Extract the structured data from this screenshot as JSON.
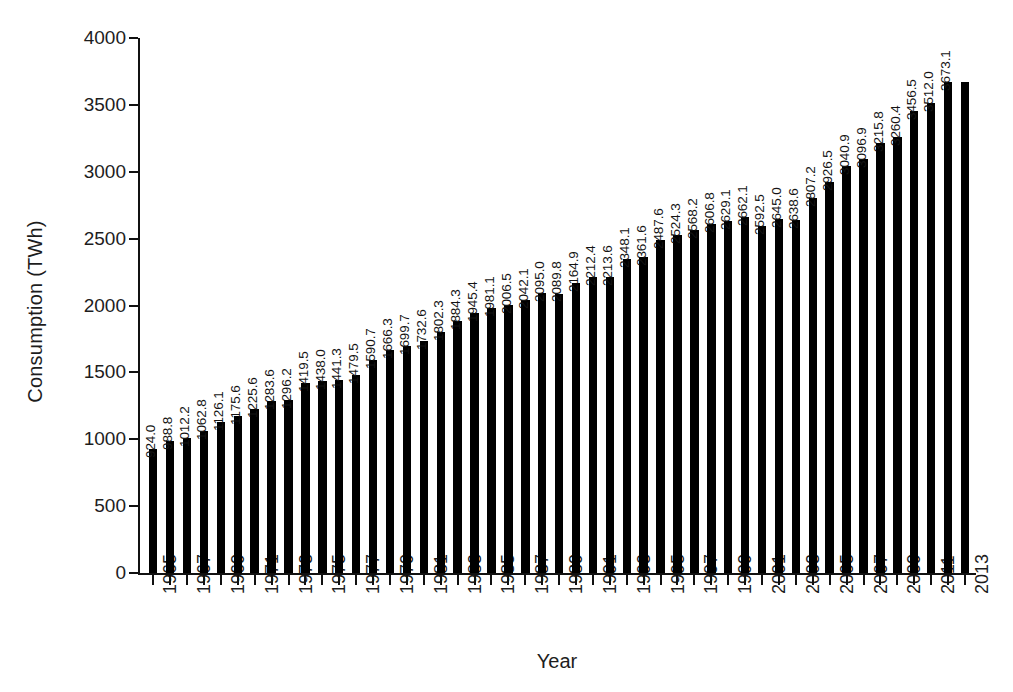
{
  "chart_data": {
    "type": "bar",
    "title": "",
    "xlabel": "Year",
    "ylabel": "Consumption (TWh)",
    "ylim": [
      0,
      4000
    ],
    "yticks": [
      0,
      500,
      1000,
      1500,
      2000,
      2500,
      3000,
      3500,
      4000
    ],
    "ytick_labels": [
      "0",
      "500",
      "1000",
      "1500",
      "2000",
      "2500",
      "3000",
      "3500",
      "4000"
    ],
    "grid": false,
    "legend": null,
    "bar_color": "#000000",
    "xtick_label_interval": 2,
    "xtick_labels_shown": [
      "1965",
      "1967",
      "1969",
      "1971",
      "1973",
      "1975",
      "1977",
      "1979",
      "1981",
      "1983",
      "1985",
      "1987",
      "1989",
      "1991",
      "1993",
      "1995",
      "1997",
      "1999",
      "2001",
      "2003",
      "2005",
      "2007",
      "2009",
      "2011"
    ],
    "categories": [
      "1965",
      "1966",
      "1967",
      "1968",
      "1969",
      "1970",
      "1971",
      "1972",
      "1973",
      "1974",
      "1975",
      "1976",
      "1977",
      "1978",
      "1979",
      "1980",
      "1981",
      "1982",
      "1983",
      "1984",
      "1985",
      "1986",
      "1987",
      "1988",
      "1989",
      "1990",
      "1991",
      "1992",
      "1993",
      "1994",
      "1995",
      "1996",
      "1997",
      "1998",
      "1999",
      "2000",
      "2001",
      "2002",
      "2003",
      "2004",
      "2005",
      "2006",
      "2007",
      "2008",
      "2009",
      "2010",
      "2011",
      "2012",
      "2013"
    ],
    "values": [
      924.0,
      988.8,
      1012.2,
      1062.8,
      1126.1,
      1175.6,
      1225.6,
      1283.6,
      1296.2,
      1419.5,
      1438.0,
      1441.3,
      1479.5,
      1590.7,
      1666.3,
      1699.7,
      1732.6,
      1802.3,
      1884.3,
      1945.4,
      1981.1,
      2006.5,
      2042.1,
      2095.0,
      2089.8,
      2164.9,
      2212.4,
      2213.6,
      2348.1,
      2361.6,
      2487.6,
      2524.3,
      2568.2,
      2606.8,
      2629.1,
      2662.1,
      2592.5,
      2645.0,
      2638.6,
      2807.2,
      2926.5,
      3040.9,
      3096.9,
      3215.8,
      3260.4,
      3456.5,
      3512.0,
      3673.1,
      3673.1
    ],
    "value_labels": [
      "924.0",
      "988.8",
      "1012.2",
      "1062.8",
      "1126.1",
      "1175.6",
      "1225.6",
      "1283.6",
      "1296.2",
      "1419.5",
      "1438.0",
      "1441.3",
      "1479.5",
      "1590.7",
      "1666.3",
      "1699.7",
      "1732.6",
      "1802.3",
      "1884.3",
      "1945.4",
      "1981.1",
      "2006.5",
      "2042.1",
      "2095.0",
      "2089.8",
      "2164.9",
      "2212.4",
      "2213.6",
      "2348.1",
      "2361.6",
      "2487.6",
      "2524.3",
      "2568.2",
      "2606.8",
      "2629.1",
      "2662.1",
      "2592.5",
      "2645.0",
      "2638.6",
      "2807.2",
      "2926.5",
      "3040.9",
      "3096.9",
      "3215.8",
      "3260.4",
      "3456.5",
      "3512.0",
      "3673.1",
      ""
    ]
  }
}
